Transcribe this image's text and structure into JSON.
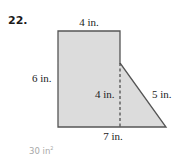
{
  "problem": {
    "number": "22.",
    "answer_value": "30 in",
    "answer_exponent": "2"
  },
  "figure": {
    "shape": "composite rectangle + right triangle",
    "fill_color": "#dcdcdc",
    "stroke_color": "#555555",
    "labels": {
      "top": "4 in.",
      "left": "6 in.",
      "height_dashed": "4 in.",
      "hypotenuse": "5 in.",
      "bottom": "7 in."
    }
  }
}
